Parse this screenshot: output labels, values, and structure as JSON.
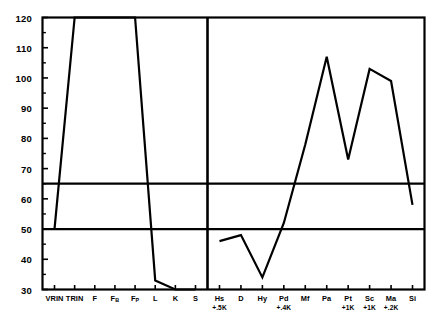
{
  "chart_data": {
    "type": "line",
    "title": "",
    "subtitle": "",
    "xlabel": "",
    "ylabel": "",
    "ylim": [
      30,
      120
    ],
    "y_ticks_major": [
      30,
      40,
      50,
      60,
      70,
      80,
      90,
      100,
      110,
      120
    ],
    "y_ticks_minor": [
      35,
      45,
      55,
      65,
      75,
      85,
      95,
      105,
      115
    ],
    "grid": false,
    "legend": "none",
    "reference_lines": [
      65,
      50
    ],
    "panels": [
      {
        "name": "validity-scales",
        "categories": [
          "VRIN",
          "TRIN",
          "F",
          "FB",
          "FP",
          "L",
          "K",
          "S"
        ],
        "category_labels": [
          "VRIN",
          "TRIN",
          "F",
          "F",
          "F",
          "L",
          "K",
          "S"
        ],
        "category_subscripts": [
          "",
          "",
          "",
          "B",
          "P",
          "",
          "",
          ""
        ],
        "sublabels": [
          "",
          "",
          "",
          "",
          "",
          "",
          "",
          ""
        ],
        "values": [
          50,
          120,
          120,
          120,
          120,
          33,
          30,
          30
        ]
      },
      {
        "name": "clinical-scales",
        "categories": [
          "Hs",
          "D",
          "Hy",
          "Pd",
          "Mf",
          "Pa",
          "Pt",
          "Sc",
          "Ma",
          "Si"
        ],
        "category_labels": [
          "Hs",
          "D",
          "Hy",
          "Pd",
          "Mf",
          "Pa",
          "Pt",
          "Sc",
          "Ma",
          "Si"
        ],
        "category_subscripts": [
          "",
          "",
          "",
          "",
          "",
          "",
          "",
          "",
          "",
          ""
        ],
        "sublabels": [
          "+.5K",
          "",
          "",
          "+.4K",
          "",
          "",
          "+1K",
          "+1K",
          "+.2K",
          ""
        ],
        "values": [
          46,
          48,
          34,
          52,
          78,
          107,
          73,
          103,
          99,
          58
        ]
      }
    ],
    "colors": {
      "line": "#000000",
      "axis": "#000000",
      "reference_line": "#000000",
      "background": "#ffffff",
      "text": "#000000"
    }
  }
}
